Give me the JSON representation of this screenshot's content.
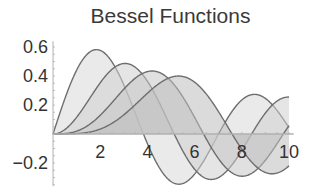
{
  "chart_data": {
    "type": "area",
    "title": "Bessel Functions",
    "xlabel": "",
    "ylabel": "",
    "xlim": [
      0,
      10
    ],
    "ylim": [
      -0.3,
      0.6
    ],
    "x_ticks": [
      2,
      4,
      6,
      8,
      10
    ],
    "x_tick_labels": [
      "2",
      "4",
      "6",
      "8",
      "10"
    ],
    "y_ticks": [
      0.6,
      0.4,
      0.2,
      -0.2
    ],
    "y_tick_labels": [
      "0.6",
      "0.4",
      "0.2",
      "-0.2"
    ],
    "grid": false,
    "legend": null,
    "filling": "to axis",
    "series": [
      {
        "name": "BesselJ[1,x]",
        "order": 1,
        "peak": {
          "x": 1.84,
          "y": 0.58
        },
        "fill": "#d8d8d8",
        "stroke": "#6e6e6e"
      },
      {
        "name": "BesselJ[2,x]",
        "order": 2,
        "peak": {
          "x": 3.05,
          "y": 0.49
        },
        "fill": "#cfcfcf",
        "stroke": "#6e6e6e"
      },
      {
        "name": "BesselJ[3,x]",
        "order": 3,
        "peak": {
          "x": 4.2,
          "y": 0.43
        },
        "fill": "#c6c6c6",
        "stroke": "#6e6e6e"
      },
      {
        "name": "BesselJ[4,x]",
        "order": 4,
        "peak": {
          "x": 5.32,
          "y": 0.4
        },
        "fill": "#bdbdbd",
        "stroke": "#6e6e6e"
      }
    ]
  },
  "colors": {
    "axis": "#b0b0b0",
    "text": "#333333",
    "curve": "#6e6e6e"
  }
}
